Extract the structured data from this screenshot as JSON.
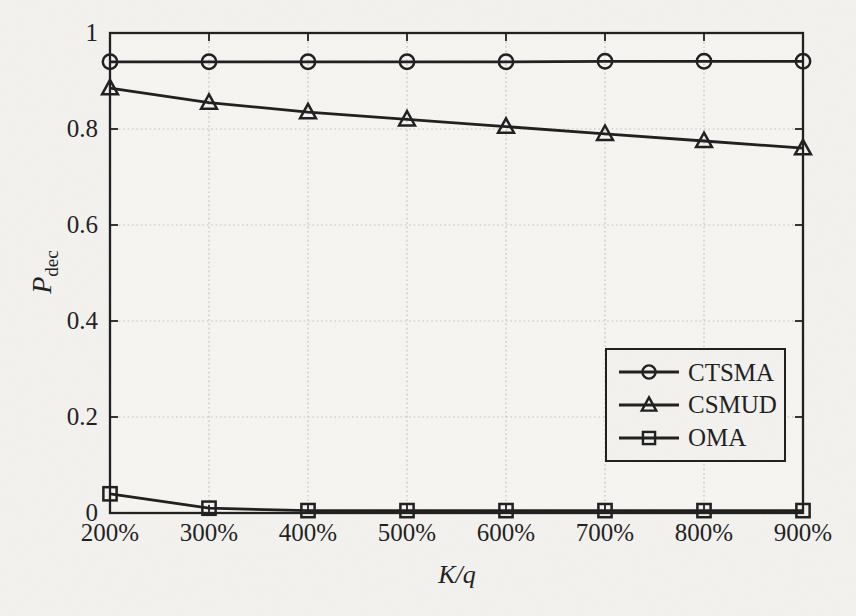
{
  "colors": {
    "ink": "#1d1d1d",
    "grid": "#c2c1bd",
    "page_background": "#f3f2ef",
    "plot_background": "#f6f5f2"
  },
  "chart_data": {
    "type": "line",
    "title": "",
    "xlabel": "K/q",
    "ylabel": "P_dec",
    "ylabel_main": "P",
    "ylabel_sub": "dec",
    "categories": [
      "200%",
      "300%",
      "400%",
      "500%",
      "600%",
      "700%",
      "800%",
      "900%"
    ],
    "x_numeric": [
      200,
      300,
      400,
      500,
      600,
      700,
      800,
      900
    ],
    "ylim": [
      0,
      1
    ],
    "yticks": [
      0,
      0.2,
      0.4,
      0.6,
      0.8,
      1
    ],
    "ytick_labels": [
      "0",
      "0.2",
      "0.4",
      "0.6",
      "0.8",
      "1"
    ],
    "grid": true,
    "legend_position": "right-middle",
    "series": [
      {
        "name": "CTSMA",
        "marker": "circle",
        "values": [
          0.94,
          0.94,
          0.94,
          0.94,
          0.94,
          0.941,
          0.941,
          0.941
        ]
      },
      {
        "name": "CSMUD",
        "marker": "triangle",
        "values": [
          0.885,
          0.855,
          0.835,
          0.82,
          0.805,
          0.79,
          0.775,
          0.76
        ]
      },
      {
        "name": "OMA",
        "marker": "square",
        "values": [
          0.04,
          0.01,
          0.005,
          0.005,
          0.005,
          0.005,
          0.005,
          0.005
        ]
      }
    ]
  }
}
